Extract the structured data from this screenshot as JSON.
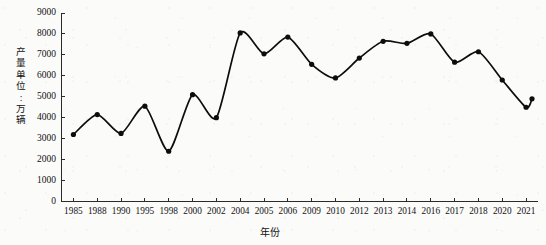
{
  "chart_data": {
    "type": "line",
    "title": "",
    "xlabel": "年份",
    "ylabel": "产量（单位：万辆）",
    "ylabel_chars": [
      "产",
      "量",
      "单",
      "位",
      ":",
      "万",
      "辆"
    ],
    "categories": [
      "1985",
      "1988",
      "1990",
      "1995",
      "1998",
      "2000",
      "2002",
      "2004",
      "2005",
      "2006",
      "2009",
      "2010",
      "2012",
      "2013",
      "2014",
      "2016",
      "2017",
      "2018",
      "2020",
      "2021"
    ],
    "values": [
      3200,
      4150,
      3250,
      4550,
      2400,
      5100,
      4000,
      8050,
      7050,
      7850,
      6550,
      5900,
      6850,
      7650,
      7550,
      8000,
      6650,
      7150,
      5800,
      4500
    ],
    "extra_points": [
      {
        "x": "2021",
        "value": 4900,
        "note": "final rising point at right end"
      }
    ],
    "ylim": [
      0,
      9000
    ],
    "yticks": [
      0,
      1000,
      2000,
      3000,
      4000,
      5000,
      6000,
      7000,
      8000,
      9000
    ],
    "ytick_labels": [
      "0",
      "1000",
      "2000",
      "3000",
      "4000",
      "5000",
      "6000",
      "7000",
      "8000",
      "9000"
    ],
    "grid": false,
    "legend": null,
    "marker": "filled-circle",
    "line_color": "#0d0d0d",
    "background_color": "#fbfbfa"
  },
  "axes": {
    "y_axis_name": "y-axis",
    "x_axis_name": "x-axis"
  }
}
